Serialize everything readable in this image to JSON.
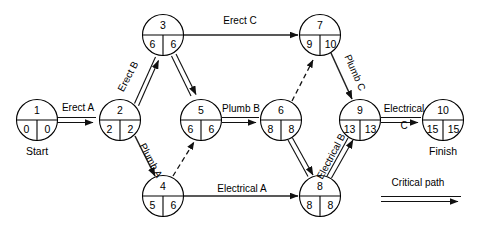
{
  "diagram": {
    "type": "network-activity-diagram",
    "legend": {
      "critical_path_label": "Critical path"
    },
    "nodes": [
      {
        "id": "1",
        "early": "0",
        "late": "0",
        "caption": "Start",
        "cx": 37,
        "cy": 120
      },
      {
        "id": "2",
        "early": "2",
        "late": "2",
        "caption": "",
        "cx": 120,
        "cy": 120
      },
      {
        "id": "3",
        "early": "6",
        "late": "6",
        "caption": "",
        "cx": 163,
        "cy": 35
      },
      {
        "id": "4",
        "early": "5",
        "late": "6",
        "caption": "",
        "cx": 163,
        "cy": 196
      },
      {
        "id": "5",
        "early": "6",
        "late": "6",
        "caption": "",
        "cx": 201,
        "cy": 120
      },
      {
        "id": "6",
        "early": "8",
        "late": "8",
        "caption": "",
        "cx": 281,
        "cy": 120
      },
      {
        "id": "7",
        "early": "9",
        "late": "10",
        "caption": "",
        "cx": 320,
        "cy": 35
      },
      {
        "id": "8",
        "early": "8",
        "late": "8",
        "caption": "",
        "cx": 320,
        "cy": 196
      },
      {
        "id": "9",
        "early": "13",
        "late": "13",
        "caption": "",
        "cx": 360,
        "cy": 120
      },
      {
        "id": "10",
        "early": "15",
        "late": "15",
        "caption": "Finish",
        "cx": 443,
        "cy": 120
      }
    ],
    "edges": [
      {
        "from": "1",
        "to": "2",
        "label": "Erect A",
        "style": "critical"
      },
      {
        "from": "2",
        "to": "3",
        "label": "Erect B",
        "style": "critical"
      },
      {
        "from": "2",
        "to": "4",
        "label": "Plumb A",
        "style": "single"
      },
      {
        "from": "3",
        "to": "7",
        "label": "Erect C",
        "style": "single"
      },
      {
        "from": "3",
        "to": "5",
        "label": "",
        "style": "critical"
      },
      {
        "from": "4",
        "to": "5",
        "label": "",
        "style": "dashed"
      },
      {
        "from": "4",
        "to": "8",
        "label": "Electrical A",
        "style": "single"
      },
      {
        "from": "5",
        "to": "6",
        "label": "Plumb B",
        "style": "critical"
      },
      {
        "from": "6",
        "to": "7",
        "label": "",
        "style": "dashed"
      },
      {
        "from": "6",
        "to": "8",
        "label": "",
        "style": "critical"
      },
      {
        "from": "7",
        "to": "9",
        "label": "Plumb C",
        "style": "single"
      },
      {
        "from": "8",
        "to": "9",
        "label": "Electrical B",
        "style": "critical"
      },
      {
        "from": "9",
        "to": "10",
        "label": "Electrical C",
        "style": "critical"
      }
    ],
    "edge_labels": [
      {
        "key": "erect_a",
        "text": "Erect A",
        "x": 78,
        "y": 111,
        "rotate": 0,
        "lines": [
          "Erect A"
        ]
      },
      {
        "key": "erect_b",
        "text": "Erect B",
        "x": 131,
        "y": 78,
        "rotate": -62,
        "lines": [
          "Erect B"
        ]
      },
      {
        "key": "plumb_a",
        "text": "Plumb A",
        "x": 147,
        "y": 160,
        "rotate": 62,
        "lines": [
          "Plumb A"
        ]
      },
      {
        "key": "erect_c",
        "text": "Erect C",
        "x": 238,
        "y": 24,
        "rotate": 0,
        "lines": [
          "Erect C"
        ]
      },
      {
        "key": "plumb_b",
        "text": "Plumb B",
        "x": 241,
        "y": 112,
        "rotate": 0,
        "lines": [
          "Plumb B"
        ]
      },
      {
        "key": "electrical_a",
        "text": "Electrical A",
        "x": 242,
        "y": 192,
        "rotate": 0,
        "lines": [
          "Electrical A"
        ]
      },
      {
        "key": "plumb_c",
        "text": "Plumb C",
        "x": 351,
        "y": 72,
        "rotate": 67,
        "lines": [
          "Plumb C"
        ]
      },
      {
        "key": "electrical_b",
        "text": "Electrical B",
        "x": 336,
        "y": 158,
        "rotate": -66,
        "lines": [
          "Electrical B"
        ]
      },
      {
        "key": "electrical_c",
        "text": "Electrical C",
        "x": 404,
        "y": 112,
        "rotate": 0,
        "lines": [
          "Electrical",
          "C"
        ]
      }
    ],
    "legend_position": {
      "x": 418,
      "y": 183
    }
  }
}
